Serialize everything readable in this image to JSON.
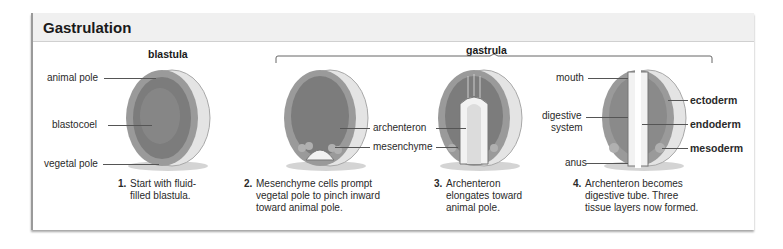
{
  "panel": {
    "title": "Gastrulation"
  },
  "stages": {
    "blastula": "blastula",
    "gastrula": "gastrula"
  },
  "labels": {
    "animal_pole": "animal pole",
    "blastocoel": "blastocoel",
    "vegetal_pole": "vegetal pole",
    "archenteron": "archenteron",
    "mesenchyme": "mesenchyme",
    "mouth": "mouth",
    "digestive_system_1": "digestive",
    "digestive_system_2": "system",
    "anus": "anus",
    "ectoderm": "ectoderm",
    "endoderm": "endoderm",
    "mesoderm": "mesoderm"
  },
  "steps": [
    {
      "num": "1.",
      "text": "Start with fluid-\nfilled blastula."
    },
    {
      "num": "2.",
      "text": "Mesenchyme cells prompt\nvegetal pole to pinch inward\ntoward animal pole."
    },
    {
      "num": "3.",
      "text": "Archenteron\nelongates toward\nanimal pole."
    },
    {
      "num": "4.",
      "text": "Archenteron becomes\ndigestive tube. Three\ntissue layers now formed."
    }
  ],
  "colors": {
    "header_bg": "#f0f0f0",
    "embryo_outer": "#8a8a8a",
    "embryo_cavity": "#6e6e6e",
    "cell_layer": "#9c9c9c"
  }
}
